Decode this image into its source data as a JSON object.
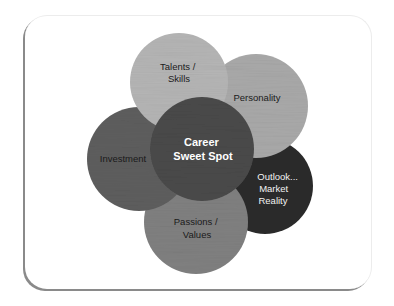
{
  "diagram": {
    "type": "overlapping-circles",
    "center": {
      "label_lines": [
        "Career",
        "Sweet Spot"
      ],
      "color": "#4a4a4a"
    },
    "circles": [
      {
        "id": "talents",
        "label_lines": [
          "Talents /",
          "Skills"
        ],
        "color": "#b5b5b5",
        "text_color": "#1a1a1a"
      },
      {
        "id": "personality",
        "label_lines": [
          "Personality"
        ],
        "color": "#a9a9a9",
        "text_color": "#1a1a1a"
      },
      {
        "id": "outlook",
        "label_lines": [
          "Outlook...",
          "Market",
          "Reality"
        ],
        "color": "#2b2b2b",
        "text_color": "#f2f2f2"
      },
      {
        "id": "passions",
        "label_lines": [
          "Passions /",
          "Values"
        ],
        "color": "#808080",
        "text_color": "#1a1a1a"
      },
      {
        "id": "investment",
        "label_lines": [
          "Investment"
        ],
        "color": "#5e5e5e",
        "text_color": "#1a1a1a"
      }
    ]
  }
}
